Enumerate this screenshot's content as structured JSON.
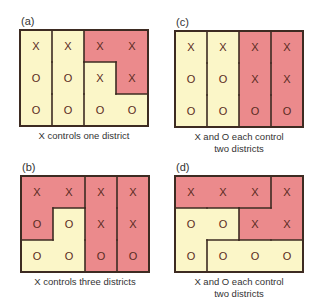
{
  "colors": {
    "x_district": "#eb8a8c",
    "o_district": "#fbf6c8",
    "border": "#3d2b22",
    "mark": "#5a2a22"
  },
  "panels": [
    {
      "id": "a",
      "label": "(a)",
      "caption_lines": [
        "X controls one district"
      ],
      "left": 20,
      "top": 30,
      "cells": [
        [
          "X",
          "X",
          "X",
          "X"
        ],
        [
          "O",
          "O",
          "X",
          "X"
        ],
        [
          "O",
          "O",
          "O",
          "O"
        ]
      ],
      "fill": [
        [
          "o",
          "o",
          "x",
          "x"
        ],
        [
          "o",
          "o",
          "o",
          "x"
        ],
        [
          "o",
          "o",
          "o",
          "o"
        ]
      ],
      "district_of": [
        [
          0,
          1,
          3,
          3
        ],
        [
          0,
          1,
          2,
          3
        ],
        [
          0,
          1,
          2,
          2
        ]
      ]
    },
    {
      "id": "c",
      "label": "(c)",
      "caption_lines": [
        "X and O each control",
        "two districts"
      ],
      "left": 175,
      "top": 31,
      "cells": [
        [
          "X",
          "X",
          "X",
          "X"
        ],
        [
          "O",
          "O",
          "X",
          "X"
        ],
        [
          "O",
          "O",
          "O",
          "O"
        ]
      ],
      "fill": [
        [
          "o",
          "o",
          "x",
          "x"
        ],
        [
          "o",
          "o",
          "x",
          "x"
        ],
        [
          "o",
          "o",
          "x",
          "x"
        ]
      ],
      "district_of": [
        [
          0,
          1,
          2,
          3
        ],
        [
          0,
          1,
          2,
          3
        ],
        [
          0,
          1,
          2,
          3
        ]
      ]
    },
    {
      "id": "b",
      "label": "(b)",
      "caption_lines": [
        "X controls three districts"
      ],
      "left": 21,
      "top": 176,
      "cells": [
        [
          "X",
          "X",
          "X",
          "X"
        ],
        [
          "O",
          "O",
          "X",
          "X"
        ],
        [
          "O",
          "O",
          "O",
          "O"
        ]
      ],
      "fill": [
        [
          "x",
          "x",
          "x",
          "x"
        ],
        [
          "x",
          "o",
          "x",
          "x"
        ],
        [
          "o",
          "o",
          "x",
          "x"
        ]
      ],
      "district_of": [
        [
          0,
          0,
          2,
          3
        ],
        [
          0,
          1,
          2,
          3
        ],
        [
          1,
          1,
          2,
          3
        ]
      ]
    },
    {
      "id": "d",
      "label": "(d)",
      "caption_lines": [
        "X and O each control",
        "two districts"
      ],
      "left": 175,
      "top": 176,
      "cells": [
        [
          "X",
          "X",
          "X",
          "X"
        ],
        [
          "O",
          "O",
          "X",
          "X"
        ],
        [
          "O",
          "O",
          "O",
          "O"
        ]
      ],
      "fill": [
        [
          "x",
          "x",
          "x",
          "x"
        ],
        [
          "o",
          "o",
          "x",
          "x"
        ],
        [
          "o",
          "o",
          "o",
          "o"
        ]
      ],
      "district_of": [
        [
          0,
          0,
          0,
          2
        ],
        [
          1,
          1,
          2,
          2
        ],
        [
          1,
          3,
          3,
          3
        ]
      ]
    }
  ]
}
